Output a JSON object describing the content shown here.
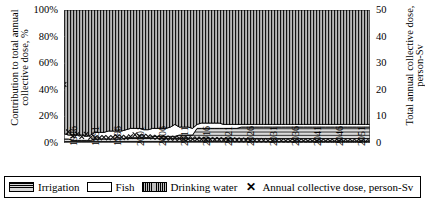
{
  "chart_data": {
    "type": "area",
    "title": "",
    "subtitle": "",
    "ylabel_left": "Contribution to total annual collective dose, %",
    "ylabel_right": "Total annual collective dose, person-Sv",
    "xlabel": "",
    "ylim_left": [
      0,
      100
    ],
    "ylim_right": [
      0,
      50
    ],
    "ytick_labels_left": [
      "100%",
      "80%",
      "60%",
      "40%",
      "20%",
      "0%"
    ],
    "ytick_values_left": [
      100,
      80,
      60,
      40,
      20,
      0
    ],
    "ytick_labels_right": [
      "50",
      "40",
      "30",
      "20",
      "10",
      "0"
    ],
    "ytick_values_right": [
      50,
      40,
      30,
      20,
      10,
      0
    ],
    "grid": false,
    "legend_position": "bottom",
    "x": [
      1986,
      1987,
      1988,
      1989,
      1990,
      1991,
      1992,
      1993,
      1994,
      1995,
      1996,
      1997,
      1998,
      1999,
      2000,
      2001,
      2002,
      2003,
      2004,
      2005,
      2006,
      2007,
      2008,
      2009,
      2010,
      2011,
      2012,
      2013,
      2014,
      2015,
      2016,
      2017,
      2018,
      2019,
      2020,
      2021,
      2022,
      2023,
      2024,
      2025,
      2026,
      2027,
      2028,
      2029,
      2030,
      2031,
      2032,
      2033,
      2034,
      2035,
      2036,
      2037,
      2038,
      2039,
      2040,
      2041,
      2042,
      2043,
      2044,
      2045,
      2046,
      2047,
      2048,
      2049,
      2050,
      2051,
      2052,
      2053,
      2054,
      2055
    ],
    "xtick_labels": [
      "1986",
      "1991",
      "1996",
      "2001",
      "2006",
      "2011",
      "2016",
      "2021",
      "2026",
      "2031",
      "2036",
      "2041",
      "2046",
      "2051"
    ],
    "xtick_values": [
      1986,
      1991,
      1996,
      2001,
      2006,
      2011,
      2016,
      2021,
      2026,
      2031,
      2036,
      2041,
      2046,
      2051
    ],
    "series": [
      {
        "name": "Irrigation",
        "fill": "horizontal-lines",
        "stack_order": 1,
        "values": [
          3,
          3,
          2,
          2,
          2,
          2,
          2,
          3,
          3,
          3,
          3,
          3,
          3,
          3,
          4,
          4,
          4,
          4,
          4,
          4,
          5,
          5,
          5,
          5,
          5,
          5,
          6,
          6,
          6,
          6,
          11,
          11,
          11,
          11,
          11,
          11,
          11,
          11,
          11,
          11,
          12,
          12,
          12,
          12,
          12,
          12,
          12,
          12,
          12,
          12,
          12,
          12,
          12,
          12,
          12,
          12,
          12,
          12,
          12,
          12,
          12,
          12,
          12,
          12,
          12,
          12,
          12,
          12,
          12,
          12
        ]
      },
      {
        "name": "Fish",
        "fill": "white",
        "stack_order": 2,
        "values": [
          4,
          3,
          4,
          4,
          4,
          3,
          4,
          5,
          5,
          5,
          6,
          6,
          6,
          6,
          6,
          7,
          7,
          7,
          6,
          6,
          6,
          6,
          6,
          6,
          7,
          9,
          6,
          6,
          6,
          5,
          3,
          4,
          4,
          4,
          4,
          4,
          3,
          3,
          3,
          3,
          2,
          2,
          2,
          2,
          2,
          2,
          2,
          2,
          2,
          2,
          2,
          2,
          2,
          2,
          2,
          2,
          2,
          2,
          2,
          2,
          2,
          2,
          2,
          2,
          2,
          2,
          2,
          2,
          2,
          2
        ]
      },
      {
        "name": "Drinking water",
        "fill": "vertical-lines",
        "stack_order": 3,
        "values": [
          93,
          94,
          94,
          94,
          94,
          95,
          94,
          92,
          92,
          92,
          91,
          91,
          91,
          91,
          90,
          89,
          89,
          89,
          90,
          90,
          89,
          89,
          89,
          89,
          88,
          86,
          88,
          88,
          88,
          89,
          86,
          85,
          85,
          85,
          85,
          85,
          86,
          86,
          86,
          86,
          86,
          86,
          86,
          86,
          86,
          86,
          86,
          86,
          86,
          86,
          86,
          86,
          86,
          86,
          86,
          86,
          86,
          86,
          86,
          86,
          86,
          86,
          86,
          86,
          86,
          86,
          86,
          86,
          86,
          86
        ]
      }
    ],
    "marker_series": {
      "name": "Annual collective dose, person-Sv",
      "marker": "x",
      "axis": "right",
      "values": [
        22.0,
        4.2,
        2.6,
        3.3,
        2.4,
        3.3,
        2.1,
        2.0,
        1.9,
        2.1,
        1.9,
        2.1,
        2.4,
        2.2,
        2.0,
        2.4,
        3.1,
        2.6,
        2.6,
        2.4,
        2.2,
        2.1,
        2.0,
        1.9,
        1.8,
        1.8,
        1.7,
        1.6,
        1.6,
        1.5,
        1.5,
        1.4,
        1.4,
        1.3,
        1.3,
        1.3,
        1.2,
        1.2,
        1.2,
        1.1,
        1.1,
        1.1,
        1.0,
        1.0,
        1.0,
        1.0,
        0.9,
        0.9,
        0.9,
        0.9,
        0.8,
        0.8,
        0.8,
        0.8,
        0.8,
        0.7,
        0.7,
        0.7,
        0.7,
        0.7,
        0.7,
        0.6,
        0.6,
        0.6,
        0.6,
        0.6,
        0.6,
        0.5,
        0.5,
        0.5
      ]
    }
  },
  "legend": {
    "items": [
      {
        "label": "Irrigation",
        "swatch": "irrigation-swatch"
      },
      {
        "label": "Fish",
        "swatch": "fish-swatch"
      },
      {
        "label": "Drinking water",
        "swatch": "drinking-water-swatch"
      },
      {
        "label": "Annual collective dose, person-Sv",
        "swatch": "x-marker"
      }
    ],
    "marker_glyph": "✕"
  }
}
